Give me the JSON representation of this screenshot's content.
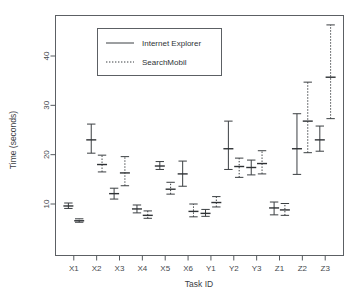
{
  "chart_data": {
    "type": "scatter",
    "title": "",
    "subtitle": "",
    "xlabel": "Task ID",
    "ylabel": "Time (seconds)",
    "categories": [
      "X1",
      "X2",
      "X3",
      "X4",
      "X5",
      "X6",
      "Y1",
      "Y2",
      "Y3",
      "Z1",
      "Z2",
      "Z3"
    ],
    "xtick_labels": [
      "X1",
      "X2",
      "X3",
      "X4",
      "X5",
      "X6",
      "Y1",
      "Y2",
      "Y3",
      "Z1",
      "Z2",
      "Z3"
    ],
    "ytick_labels": [
      "10",
      "20",
      "30",
      "40"
    ],
    "yticks": [
      10,
      20,
      30,
      40
    ],
    "ylim": [
      4.5,
      47.5
    ],
    "grid": false,
    "legend_position": "top-center",
    "error_bars": "confidence-interval-with-caps",
    "series": [
      {
        "name": "Internet Explorer",
        "line_style": "solid",
        "color": "#3b3f42",
        "values": [
          9.6,
          23.0,
          12.1,
          9.0,
          17.7,
          16.1,
          8.1,
          21.2,
          17.4,
          9.2,
          21.2,
          23.0
        ],
        "lower": [
          9.1,
          20.3,
          11.0,
          8.2,
          17.0,
          13.6,
          7.5,
          17.0,
          15.9,
          7.8,
          16.0,
          20.7
        ],
        "upper": [
          10.2,
          26.2,
          13.2,
          9.8,
          18.6,
          18.7,
          8.9,
          26.8,
          18.9,
          10.4,
          28.3,
          25.8
        ]
      },
      {
        "name": "SearchMobil",
        "line_style": "dotted",
        "color": "#3b3f42",
        "values": [
          6.6,
          18.0,
          16.3,
          7.7,
          13.0,
          8.5,
          10.3,
          17.6,
          18.2,
          8.8,
          26.8,
          35.7
        ],
        "lower": [
          6.3,
          16.5,
          13.7,
          7.1,
          12.0,
          7.4,
          9.4,
          15.4,
          16.1,
          7.7,
          20.4,
          27.3
        ],
        "upper": [
          7.0,
          19.9,
          19.6,
          8.6,
          14.4,
          10.0,
          11.5,
          19.3,
          20.8,
          10.1,
          34.7,
          46.3
        ]
      }
    ],
    "legend_entries": [
      {
        "label": "Internet Explorer",
        "line_style": "solid"
      },
      {
        "label": "SearchMobil",
        "line_style": "dotted"
      }
    ]
  }
}
